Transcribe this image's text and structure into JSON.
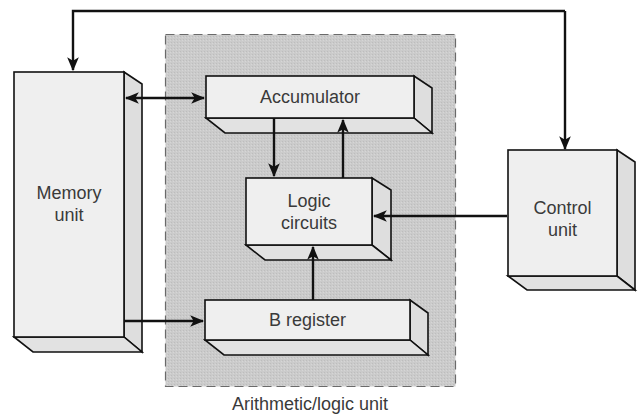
{
  "diagram": {
    "colors": {
      "background": "#ffffff",
      "alu_region_fill": "#c9c9c9",
      "alu_region_border": "#6a6a6a",
      "box_front": "#efefef",
      "box_side": "#dedede",
      "line": "#111111",
      "text": "#3a3a3a"
    },
    "blocks": {
      "memory_unit": {
        "line1": "Memory",
        "line2": "unit"
      },
      "accumulator": {
        "label": "Accumulator"
      },
      "logic_circuits": {
        "line1": "Logic",
        "line2": "circuits"
      },
      "b_register": {
        "label": "B register"
      },
      "control_unit": {
        "line1": "Control",
        "line2": "unit"
      }
    },
    "regions": {
      "alu": {
        "caption": "Arithmetic/logic unit",
        "style": "dashed"
      }
    },
    "connections": [
      {
        "from": "control_unit",
        "to": "memory_unit",
        "type": "arrow",
        "route": "top loop"
      },
      {
        "from": "control_unit",
        "to": "control_unit",
        "type": "arrow",
        "route": "top loop into control top"
      },
      {
        "from": "memory_unit",
        "to": "accumulator",
        "type": "bidirectional"
      },
      {
        "from": "accumulator",
        "to": "logic_circuits",
        "type": "arrow"
      },
      {
        "from": "logic_circuits",
        "to": "accumulator",
        "type": "arrow"
      },
      {
        "from": "control_unit",
        "to": "logic_circuits",
        "type": "arrow"
      },
      {
        "from": "b_register",
        "to": "logic_circuits",
        "type": "arrow"
      },
      {
        "from": "memory_unit",
        "to": "b_register",
        "type": "arrow"
      }
    ]
  }
}
